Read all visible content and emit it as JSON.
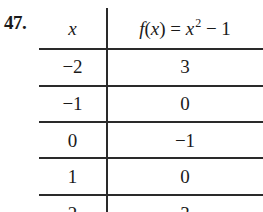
{
  "problem": {
    "number": "47."
  },
  "table": {
    "headers": {
      "x": "x",
      "fx_func": "f",
      "fx_paren_open": "(",
      "fx_var": "x",
      "fx_paren_close": ")",
      "fx_equals": " = ",
      "fx_rhs_var": "x",
      "fx_exponent": "2",
      "fx_rhs_rest": " − 1"
    },
    "rows": [
      {
        "x": "−2",
        "fx": "3"
      },
      {
        "x": "−1",
        "fx": "0"
      },
      {
        "x": "0",
        "fx": "−1"
      },
      {
        "x": "1",
        "fx": "0"
      },
      {
        "x": "2",
        "fx": "3"
      }
    ]
  }
}
